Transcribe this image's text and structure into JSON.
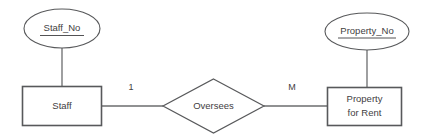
{
  "diagram": {
    "notation": "Chen ER notation",
    "background_color": "#ffffff",
    "stroke_color": "#58595b",
    "text_color": "#3f4042",
    "entities": [
      {
        "id": "staff",
        "label": "Staff",
        "shape": "rectangle"
      },
      {
        "id": "property-for-rent",
        "label_line1": "Property",
        "label_line2": "for Rent",
        "shape": "rectangle"
      }
    ],
    "attributes": [
      {
        "id": "staff-no",
        "label": "Staff_No",
        "shape": "ellipse",
        "is_primary_key": true,
        "belongs_to": "Staff"
      },
      {
        "id": "property-no",
        "label": "Property_No",
        "shape": "ellipse",
        "is_primary_key": true,
        "belongs_to": "Property for Rent"
      }
    ],
    "relationship": {
      "id": "oversees",
      "label": "Oversees",
      "shape": "diamond"
    },
    "cardinalities": [
      {
        "id": "left-cardinality",
        "label": "1",
        "side": "Staff"
      },
      {
        "id": "right-cardinality",
        "label": "M",
        "side": "Property for Rent"
      }
    ]
  }
}
